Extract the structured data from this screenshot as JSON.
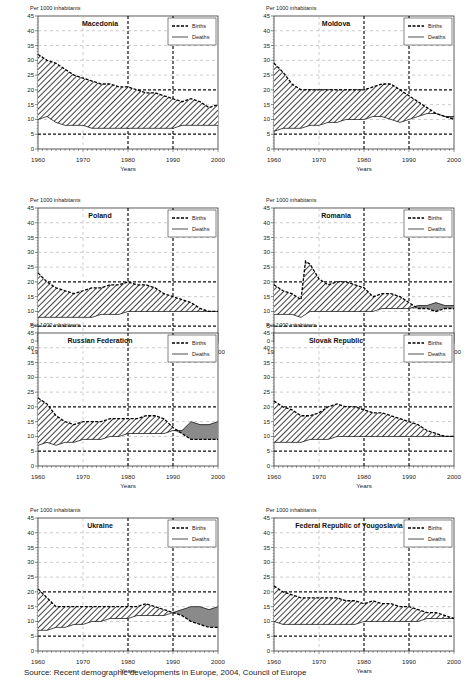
{
  "common": {
    "unit_label": "Per 1000 inhabitants",
    "xlabel": "Years",
    "legend_births": "Births",
    "legend_deaths": "Deaths",
    "x_ticks": [
      1960,
      1970,
      1980,
      1990,
      2000
    ],
    "y_ticks": [
      0,
      5,
      10,
      15,
      20,
      25,
      30,
      35,
      40,
      45
    ]
  },
  "chart_data": [
    {
      "type": "area",
      "title": "Macedonia",
      "xlabel": "Years",
      "ylabel": "Per 1000 inhabitants",
      "xlim": [
        1960,
        2000
      ],
      "ylim": [
        0,
        45
      ],
      "legend": [
        "Births",
        "Deaths"
      ],
      "legend_position": "top-right",
      "grid": true,
      "x": [
        1960,
        1962,
        1964,
        1966,
        1968,
        1970,
        1972,
        1974,
        1976,
        1978,
        1980,
        1982,
        1984,
        1986,
        1988,
        1990,
        1992,
        1994,
        1996,
        1998,
        2000
      ],
      "series": [
        {
          "name": "Births",
          "values": [
            32,
            30,
            29,
            27,
            25,
            24,
            23,
            22,
            22,
            21,
            21,
            20,
            19,
            19,
            18,
            17,
            16,
            17,
            16,
            14,
            15
          ]
        },
        {
          "name": "Deaths",
          "values": [
            10,
            11,
            9,
            8,
            8,
            8,
            7,
            7,
            7,
            7,
            7,
            7,
            7,
            7,
            7,
            7,
            8,
            8,
            8,
            8,
            8
          ]
        }
      ]
    },
    {
      "type": "area",
      "title": "Moldova",
      "xlabel": "Years",
      "ylabel": "Per 1000 inhabitants",
      "xlim": [
        1960,
        2000
      ],
      "ylim": [
        0,
        45
      ],
      "legend": [
        "Births",
        "Deaths"
      ],
      "legend_position": "top-right",
      "grid": true,
      "x": [
        1960,
        1962,
        1964,
        1966,
        1968,
        1970,
        1972,
        1974,
        1976,
        1978,
        1980,
        1982,
        1984,
        1986,
        1988,
        1990,
        1992,
        1994,
        1996,
        1998,
        2000
      ],
      "series": [
        {
          "name": "Births",
          "values": [
            29,
            26,
            22,
            20,
            20,
            20,
            20,
            20,
            20,
            20,
            20,
            21,
            22,
            22,
            20,
            18,
            16,
            14,
            12,
            11,
            10
          ]
        },
        {
          "name": "Deaths",
          "values": [
            6,
            7,
            7,
            7,
            8,
            8,
            9,
            9,
            10,
            10,
            10,
            11,
            11,
            10,
            9,
            10,
            11,
            12,
            12,
            11,
            11
          ]
        }
      ]
    },
    {
      "type": "area",
      "title": "Poland",
      "xlabel": "Years",
      "ylabel": "Per 1000 inhabitants",
      "xlim": [
        1960,
        2000
      ],
      "ylim": [
        0,
        45
      ],
      "legend": [
        "Births",
        "Deaths"
      ],
      "legend_position": "top-right",
      "grid": true,
      "x": [
        1960,
        1962,
        1964,
        1966,
        1968,
        1970,
        1972,
        1974,
        1976,
        1978,
        1980,
        1982,
        1984,
        1986,
        1988,
        1990,
        1992,
        1994,
        1996,
        1998,
        2000
      ],
      "series": [
        {
          "name": "Births",
          "values": [
            23,
            20,
            18,
            17,
            16,
            17,
            18,
            18,
            19,
            19,
            20,
            19,
            19,
            18,
            16,
            15,
            14,
            13,
            11,
            10,
            10
          ]
        },
        {
          "name": "Deaths",
          "values": [
            8,
            8,
            8,
            8,
            8,
            8,
            8,
            9,
            9,
            9,
            10,
            10,
            10,
            10,
            10,
            10,
            10,
            10,
            10,
            10,
            10
          ]
        }
      ]
    },
    {
      "type": "area",
      "title": "Romania",
      "xlabel": "Years",
      "ylabel": "Per 1000 inhabitants",
      "xlim": [
        1960,
        2000
      ],
      "ylim": [
        0,
        45
      ],
      "legend": [
        "Births",
        "Deaths"
      ],
      "legend_position": "top-right",
      "grid": true,
      "x": [
        1960,
        1962,
        1964,
        1966,
        1967,
        1968,
        1970,
        1972,
        1974,
        1976,
        1978,
        1980,
        1982,
        1984,
        1986,
        1988,
        1990,
        1992,
        1994,
        1996,
        1998,
        2000
      ],
      "series": [
        {
          "name": "Births",
          "values": [
            19,
            17,
            16,
            14,
            27,
            26,
            21,
            19,
            20,
            20,
            19,
            18,
            15,
            16,
            16,
            15,
            13,
            11,
            11,
            10,
            11,
            11
          ]
        },
        {
          "name": "Deaths",
          "values": [
            9,
            9,
            9,
            8,
            9,
            10,
            10,
            10,
            10,
            10,
            10,
            10,
            10,
            11,
            11,
            11,
            11,
            12,
            12,
            13,
            12,
            12
          ]
        }
      ]
    },
    {
      "type": "area",
      "title": "Russian Federation",
      "xlabel": "Years",
      "ylabel": "Per 1000 inhabitants",
      "xlim": [
        1960,
        2000
      ],
      "ylim": [
        0,
        45
      ],
      "legend": [
        "Births",
        "Deaths"
      ],
      "legend_position": "top-right",
      "grid": true,
      "x": [
        1960,
        1962,
        1964,
        1966,
        1968,
        1970,
        1972,
        1974,
        1976,
        1978,
        1980,
        1982,
        1984,
        1986,
        1988,
        1990,
        1992,
        1994,
        1996,
        1998,
        2000
      ],
      "series": [
        {
          "name": "Births",
          "values": [
            23,
            21,
            17,
            15,
            14,
            15,
            15,
            15,
            16,
            16,
            16,
            16,
            17,
            17,
            16,
            13,
            11,
            9,
            9,
            9,
            9
          ]
        },
        {
          "name": "Deaths",
          "values": [
            7,
            8,
            7,
            8,
            8,
            9,
            9,
            9,
            10,
            10,
            11,
            11,
            11,
            11,
            11,
            12,
            12,
            15,
            14,
            14,
            15
          ]
        }
      ]
    },
    {
      "type": "area",
      "title": "Slovak Republic",
      "xlabel": "Years",
      "ylabel": "Per 1000 inhabitants",
      "xlim": [
        1960,
        2000
      ],
      "ylim": [
        0,
        45
      ],
      "legend": [
        "Births",
        "Deaths"
      ],
      "legend_position": "top-right",
      "grid": true,
      "x": [
        1960,
        1962,
        1964,
        1966,
        1968,
        1970,
        1972,
        1974,
        1976,
        1978,
        1980,
        1982,
        1984,
        1986,
        1988,
        1990,
        1992,
        1994,
        1996,
        1998,
        2000
      ],
      "series": [
        {
          "name": "Births",
          "values": [
            22,
            20,
            19,
            17,
            17,
            18,
            20,
            21,
            20,
            20,
            19,
            18,
            18,
            17,
            16,
            15,
            14,
            12,
            11,
            10,
            10
          ]
        },
        {
          "name": "Deaths",
          "values": [
            8,
            8,
            8,
            8,
            9,
            9,
            9,
            10,
            10,
            10,
            10,
            10,
            10,
            10,
            10,
            10,
            10,
            10,
            10,
            10,
            10
          ]
        }
      ]
    },
    {
      "type": "area",
      "title": "Ukraine",
      "xlabel": "Years",
      "ylabel": "Per 1000 inhabitants",
      "xlim": [
        1960,
        2000
      ],
      "ylim": [
        0,
        45
      ],
      "legend": [
        "Births",
        "Deaths"
      ],
      "legend_position": "top-right",
      "grid": true,
      "x": [
        1960,
        1962,
        1964,
        1966,
        1968,
        1970,
        1972,
        1974,
        1976,
        1978,
        1980,
        1982,
        1984,
        1986,
        1988,
        1990,
        1992,
        1994,
        1996,
        1998,
        2000
      ],
      "series": [
        {
          "name": "Births",
          "values": [
            21,
            18,
            15,
            15,
            15,
            15,
            15,
            15,
            15,
            15,
            15,
            15,
            16,
            15,
            14,
            13,
            12,
            10,
            9,
            8,
            8
          ]
        },
        {
          "name": "Deaths",
          "values": [
            7,
            7,
            8,
            8,
            9,
            9,
            10,
            10,
            11,
            11,
            11,
            12,
            12,
            12,
            12,
            13,
            14,
            15,
            15,
            14,
            15
          ]
        }
      ]
    },
    {
      "type": "area",
      "title": "Federal Republic of Yougoslavia",
      "xlabel": "Years",
      "ylabel": "Per 1000 inhabitants",
      "xlim": [
        1960,
        2000
      ],
      "ylim": [
        0,
        45
      ],
      "legend": [
        "Births",
        "Deaths"
      ],
      "legend_position": "top-right",
      "grid": true,
      "x": [
        1960,
        1962,
        1964,
        1966,
        1968,
        1970,
        1972,
        1974,
        1976,
        1978,
        1980,
        1982,
        1984,
        1986,
        1988,
        1990,
        1992,
        1994,
        1996,
        1998,
        2000
      ],
      "series": [
        {
          "name": "Births",
          "values": [
            22,
            20,
            19,
            18,
            18,
            18,
            18,
            18,
            17,
            17,
            16,
            17,
            16,
            16,
            15,
            15,
            14,
            13,
            13,
            12,
            11
          ]
        },
        {
          "name": "Deaths",
          "values": [
            10,
            9,
            9,
            9,
            9,
            9,
            9,
            9,
            9,
            9,
            10,
            10,
            10,
            10,
            10,
            10,
            10,
            11,
            11,
            11,
            11
          ]
        }
      ]
    }
  ],
  "source": "Source: Recent demographic developments in Europe, 2004, Council of Europe"
}
